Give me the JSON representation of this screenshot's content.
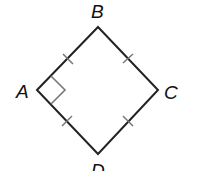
{
  "diagram": {
    "type": "quadrilateral",
    "shape": "square (rhombus with right angle)",
    "vertices": {
      "A": {
        "label": "A",
        "x": 37,
        "y": 90
      },
      "B": {
        "label": "B",
        "x": 98,
        "y": 27
      },
      "C": {
        "label": "C",
        "x": 158,
        "y": 90
      },
      "D": {
        "label": "D",
        "x": 98,
        "y": 154
      }
    },
    "sides": [
      "AB",
      "BC",
      "CD",
      "DA"
    ],
    "tick_marks": "single congruence tick on each side",
    "right_angle_marker": "A",
    "stroke_color": "#222222",
    "marker_color": "#777777"
  }
}
